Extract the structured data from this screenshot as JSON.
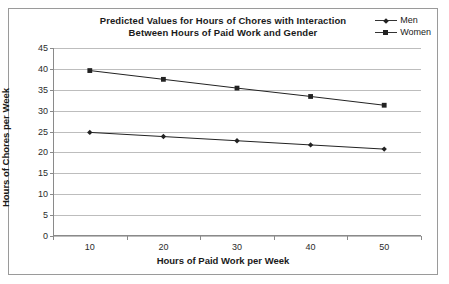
{
  "chart_data": {
    "type": "line",
    "title": "Predicted Values for Hours of Chores with Interaction Between Hours of Paid Work and Gender",
    "title_lines": [
      "Predicted Values for Hours of Chores with Interaction",
      "Between Hours of Paid Work and Gender"
    ],
    "xlabel": "Hours of Paid Work per Week",
    "ylabel": "Hours of Chores per Week",
    "categories": [
      10,
      20,
      30,
      40,
      50
    ],
    "x_tick_labels": [
      "10",
      "20",
      "30",
      "40",
      "50"
    ],
    "y_tick_labels": [
      "0",
      "5",
      "10",
      "15",
      "20",
      "25",
      "30",
      "35",
      "40",
      "45"
    ],
    "y_ticks": [
      0,
      5,
      10,
      15,
      20,
      25,
      30,
      35,
      40,
      45
    ],
    "ylim": [
      0,
      45
    ],
    "grid": "horizontal",
    "legend_position": "top-right",
    "series": [
      {
        "name": "Men",
        "marker": "diamond",
        "color": "#222222",
        "values": [
          24.8,
          23.8,
          22.8,
          21.8,
          20.8
        ]
      },
      {
        "name": "Women",
        "marker": "square",
        "color": "#222222",
        "values": [
          39.6,
          37.5,
          35.4,
          33.4,
          31.3
        ]
      }
    ]
  },
  "legend": {
    "items": [
      {
        "label": "Men"
      },
      {
        "label": "Women"
      }
    ]
  },
  "colors": {
    "gridline": "#bdbdbd",
    "axis": "#8a8a8a",
    "series": "#222222",
    "border": "#9a9a9a"
  }
}
